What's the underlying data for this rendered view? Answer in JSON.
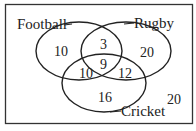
{
  "diagram": {
    "type": "venn-3-set",
    "sets": [
      {
        "id": "football",
        "label": "Football"
      },
      {
        "id": "rugby",
        "label": "Rugby"
      },
      {
        "id": "cricket",
        "label": "Cricket"
      }
    ],
    "regions": {
      "football_only": "10",
      "rugby_only": "20",
      "cricket_only": "16",
      "football_rugby_only": "3",
      "football_cricket_only": "10",
      "rugby_cricket_only": "12",
      "all_three": "9",
      "outside": "20"
    },
    "colors": {
      "stroke": "#222222",
      "background": "#ffffff",
      "border": "#333333"
    }
  }
}
